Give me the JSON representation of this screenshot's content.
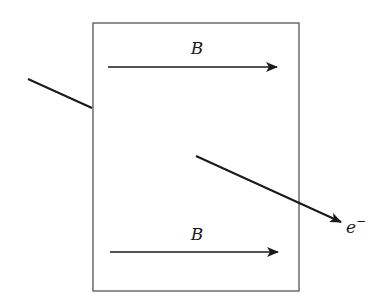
{
  "diagram": {
    "field_labels": {
      "top": "B",
      "bottom": "B"
    },
    "particle_label": {
      "base": "e",
      "superscript": "−"
    },
    "colors": {
      "stroke": "#1a1a1a",
      "box": "#555555",
      "background": "#ffffff"
    }
  }
}
